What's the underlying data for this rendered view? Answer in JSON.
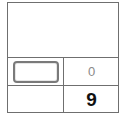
{
  "grid": {
    "top_cell": "",
    "row1": {
      "left_slot": "",
      "right_value": "0"
    },
    "row2": {
      "left_value": "",
      "right_value": "9"
    }
  },
  "colors": {
    "border": "#6f6f6f",
    "muted_text": "#8a8a8a",
    "strong_text": "#111111"
  }
}
